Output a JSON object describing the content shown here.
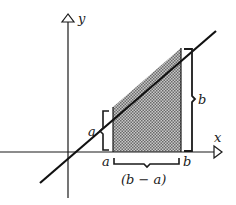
{
  "diagram": {
    "axes": {
      "x_label": "x",
      "y_label": "y"
    },
    "line": {
      "equation": "y = x"
    },
    "shaded_region": {
      "from": "a",
      "to": "b",
      "fill": "#9a9a9a"
    },
    "labels": {
      "tick_a": "a",
      "tick_b": "b",
      "height_a": "a",
      "height_b": "b",
      "width": "(b − a)"
    },
    "colors": {
      "ink": "#1a1a1a",
      "background": "#ffffff"
    }
  }
}
